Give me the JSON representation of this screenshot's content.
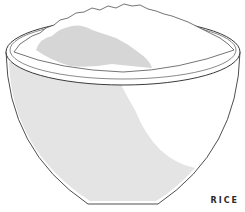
{
  "illustration": {
    "subject": "bowl of rice",
    "colors": {
      "outline": "#3a3a3a",
      "bowl_shadow": "#e4e4e4",
      "rice_shadow": "#d6d6d6",
      "background": "#ffffff"
    }
  },
  "label": {
    "text": "RICE"
  }
}
